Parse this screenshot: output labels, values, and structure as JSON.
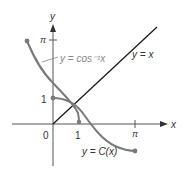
{
  "figure": {
    "axes": {
      "x_label": "x",
      "y_label": "y",
      "origin_label": "0",
      "x_ticks": [
        {
          "label": "1"
        },
        {
          "label": "π"
        }
      ],
      "y_ticks": [
        {
          "label": "1"
        },
        {
          "label": "π"
        }
      ]
    },
    "curves": [
      {
        "id": "arccos",
        "label": "y = cos⁻¹x",
        "color": "#888888"
      },
      {
        "id": "identity",
        "label": "y = x",
        "color": "#1a1a1a"
      },
      {
        "id": "cosine",
        "label": "y = C(x)",
        "color": "#777777"
      }
    ],
    "colors": {
      "axis": "#555555",
      "identity_line": "#1a1a1a",
      "curve": "#7a7a7a",
      "text": "#333333"
    }
  }
}
